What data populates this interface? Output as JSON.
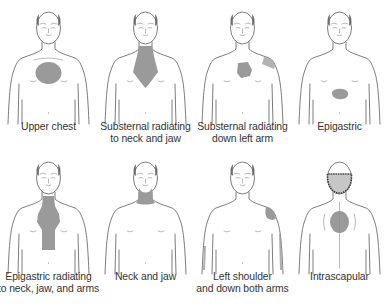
{
  "figure": {
    "type": "anatomical pain-location diagram",
    "pain_color": "#9a9a9a",
    "line_color": "#5a5a5a",
    "text_color": "#333333",
    "panels": [
      {
        "id": "upper-chest",
        "caption_lines": [
          "Upper chest",
          ""
        ],
        "view": "front",
        "regions": [
          "upper-chest"
        ]
      },
      {
        "id": "substernal-neck-jaw",
        "caption_lines": [
          "Substernal radiating",
          "to neck and jaw"
        ],
        "view": "front",
        "regions": [
          "substernal-neck"
        ]
      },
      {
        "id": "substernal-left-arm",
        "caption_lines": [
          "Substernal radiating",
          "down left arm"
        ],
        "view": "front",
        "regions": [
          "substernal",
          "left-shoulder"
        ]
      },
      {
        "id": "epigastric",
        "caption_lines": [
          "Epigastric",
          ""
        ],
        "view": "front",
        "regions": [
          "epigastric"
        ]
      },
      {
        "id": "epigastric-neck-jaw-arms",
        "caption_lines": [
          "Epigastric radiating",
          "to neck, jaw, and arms"
        ],
        "view": "front",
        "regions": [
          "epigastric-neck"
        ]
      },
      {
        "id": "neck-jaw",
        "caption_lines": [
          "Neck and jaw",
          ""
        ],
        "view": "front",
        "regions": [
          "neck-jaw"
        ]
      },
      {
        "id": "left-shoulder-both-arms",
        "caption_lines": [
          "Left shoulder",
          "and down both arms"
        ],
        "view": "front",
        "regions": [
          "left-shoulder",
          "both-arms"
        ]
      },
      {
        "id": "intrascapular",
        "caption_lines": [
          "Intrascapular",
          ""
        ],
        "view": "back",
        "regions": [
          "intrascapular"
        ]
      }
    ]
  }
}
